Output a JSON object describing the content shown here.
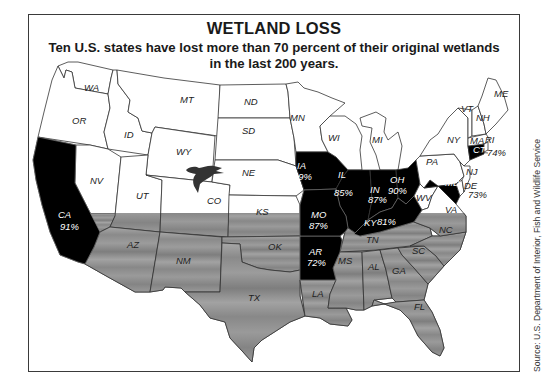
{
  "header": {
    "title": "WETLAND LOSS",
    "subtitle_line1": "Ten U.S. states have lost more than 70 percent of their original wetlands",
    "subtitle_line2": "in the last 200 years."
  },
  "source": "Source: U.S. Department of Interior, Fish and Wildlife Service",
  "colors": {
    "high_loss_fill": "#000000",
    "default_fill": "#ffffff",
    "southern_band_fill": "#8c8c8c",
    "southern_band_light": "#b0b0b0",
    "border": "#333333"
  },
  "high_loss_states": [
    {
      "code": "CA",
      "loss": "91%"
    },
    {
      "code": "IA",
      "loss": "89%"
    },
    {
      "code": "IL",
      "loss": "85%"
    },
    {
      "code": "IN",
      "loss": "87%"
    },
    {
      "code": "OH",
      "loss": "90%"
    },
    {
      "code": "MO",
      "loss": "87%"
    },
    {
      "code": "KY",
      "loss": "81%"
    },
    {
      "code": "AR",
      "loss": "72%"
    },
    {
      "code": "CT",
      "loss": "74%"
    },
    {
      "code": "MD",
      "loss": "73%"
    }
  ],
  "labels": {
    "WA": "WA",
    "OR": "OR",
    "CA": "CA",
    "CA_pct": "91%",
    "ID": "ID",
    "NV": "NV",
    "MT": "MT",
    "WY": "WY",
    "UT": "UT",
    "CO": "CO",
    "AZ": "AZ",
    "NM": "NM",
    "ND": "ND",
    "SD": "SD",
    "NE": "NE",
    "KS": "KS",
    "OK": "OK",
    "TX": "TX",
    "MN": "MN",
    "IA": "IA",
    "IA_pct": "89%",
    "MO": "MO",
    "MO_pct": "87%",
    "AR": "AR",
    "AR_pct": "72%",
    "LA": "LA",
    "WI": "WI",
    "IL": "IL",
    "IL_pct": "85%",
    "MI": "MI",
    "IN": "IN",
    "IN_pct": "87%",
    "OH": "OH",
    "OH_pct": "90%",
    "KY": "KY",
    "KY_pct": "81%",
    "TN": "TN",
    "MS": "MS",
    "AL": "AL",
    "GA": "GA",
    "FL": "FL",
    "SC": "SC",
    "NC": "NC",
    "VA": "VA",
    "WV": "WV",
    "PA": "PA",
    "NY": "NY",
    "VT": "VT",
    "NH": "NH",
    "ME": "ME",
    "MA": "MA",
    "CT": "CT",
    "CT_pct": "74%",
    "RI": "RI",
    "NJ": "NJ",
    "DE": "DE",
    "MD": "MD",
    "MD_pct": "73%"
  },
  "icons": {
    "goose": "flying-goose-silhouette"
  }
}
